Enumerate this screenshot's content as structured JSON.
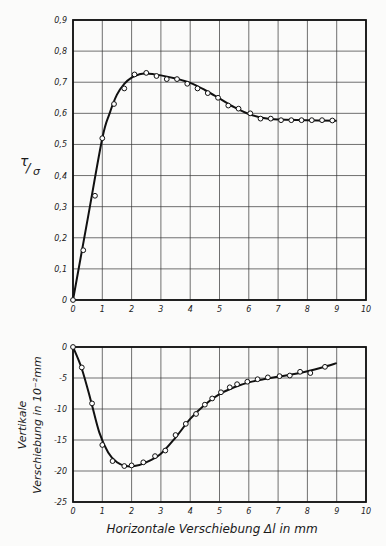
{
  "chart_data": [
    {
      "type": "line",
      "title": "",
      "xlabel": "",
      "ylabel": "τ/σ",
      "xlim": [
        0,
        10
      ],
      "ylim": [
        0,
        0.9
      ],
      "x_ticks": [
        "0",
        "1",
        "2",
        "3",
        "4",
        "5",
        "6",
        "7",
        "8",
        "9",
        "10"
      ],
      "y_ticks": [
        "0",
        "0,1",
        "0,2",
        "0,3",
        "0,4",
        "0,5",
        "0,6",
        "0,7",
        "0,8",
        "0,9"
      ],
      "grid": true,
      "series": [
        {
          "name": "measured",
          "style": "markers",
          "x": [
            0,
            0.35,
            0.75,
            1.0,
            1.4,
            1.75,
            2.1,
            2.5,
            2.85,
            3.2,
            3.55,
            3.9,
            4.25,
            4.6,
            4.95,
            5.3,
            5.65,
            6.05,
            6.4,
            6.75,
            7.1,
            7.45,
            7.8,
            8.15,
            8.5,
            8.85
          ],
          "y": [
            0,
            0.16,
            0.335,
            0.52,
            0.63,
            0.68,
            0.725,
            0.73,
            0.72,
            0.71,
            0.71,
            0.695,
            0.68,
            0.665,
            0.65,
            0.625,
            0.615,
            0.6,
            0.583,
            0.583,
            0.578,
            0.578,
            0.578,
            0.578,
            0.578,
            0.577
          ]
        },
        {
          "name": "fitted curve",
          "style": "line",
          "x": [
            0,
            0.5,
            1.0,
            1.25,
            1.5,
            1.75,
            2.0,
            2.25,
            2.5,
            3.0,
            3.5,
            4.0,
            4.5,
            5.0,
            5.5,
            6.0,
            6.5,
            7.0,
            8.0,
            9.0
          ],
          "y": [
            0,
            0.26,
            0.52,
            0.6,
            0.66,
            0.695,
            0.715,
            0.725,
            0.728,
            0.722,
            0.712,
            0.698,
            0.675,
            0.648,
            0.62,
            0.598,
            0.585,
            0.58,
            0.578,
            0.576
          ]
        }
      ]
    },
    {
      "type": "line",
      "title": "",
      "xlabel": "Horizontale Verschiebung Δl in mm",
      "ylabel": "Vertikale Verschiebung in 10⁻²mm",
      "xlim": [
        0,
        10
      ],
      "ylim": [
        -25,
        0
      ],
      "x_ticks": [
        "0",
        "1",
        "2",
        "3",
        "4",
        "5",
        "6",
        "7",
        "8",
        "9",
        "10"
      ],
      "y_ticks": [
        "0",
        "-5",
        "-10",
        "-15",
        "-20",
        "-25"
      ],
      "grid": true,
      "series": [
        {
          "name": "measured",
          "style": "markers",
          "x": [
            0,
            0.3,
            0.65,
            1.0,
            1.35,
            1.75,
            2.0,
            2.4,
            2.8,
            3.15,
            3.5,
            3.85,
            4.2,
            4.5,
            4.75,
            5.05,
            5.35,
            5.6,
            5.95,
            6.3,
            6.65,
            7.05,
            7.4,
            7.75,
            8.1,
            8.6
          ],
          "y": [
            0,
            -3.3,
            -9.1,
            -15.8,
            -18.4,
            -19.2,
            -19.1,
            -18.6,
            -17.6,
            -16.7,
            -14.2,
            -12.4,
            -10.8,
            -9.3,
            -8.3,
            -7.3,
            -6.5,
            -6.0,
            -5.6,
            -5.2,
            -4.9,
            -4.7,
            -4.6,
            -4.0,
            -4.2,
            -3.2
          ]
        },
        {
          "name": "fitted curve",
          "style": "line",
          "x": [
            0,
            0.3,
            0.6,
            0.9,
            1.2,
            1.5,
            1.8,
            2.1,
            2.5,
            3.0,
            3.5,
            4.0,
            4.5,
            5.0,
            5.5,
            6.0,
            6.5,
            7.0,
            7.5,
            8.0,
            8.5,
            9.0
          ],
          "y": [
            0,
            -3.5,
            -8.5,
            -13.8,
            -17.0,
            -18.6,
            -19.2,
            -19.2,
            -18.6,
            -17.2,
            -14.6,
            -11.6,
            -9.3,
            -7.6,
            -6.5,
            -5.7,
            -5.2,
            -4.8,
            -4.4,
            -3.9,
            -3.3,
            -2.6
          ]
        }
      ]
    }
  ],
  "labels": {
    "top_ylabel_num": "τ",
    "top_ylabel_den": "σ",
    "bottom_ylabel_line1": "Vertikale",
    "bottom_ylabel_line2": "Verschiebung in 10⁻²mm",
    "xlabel": "Horizontale Verschiebung Δl in mm"
  }
}
